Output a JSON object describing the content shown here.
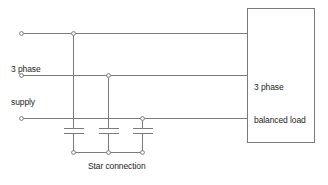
{
  "diagram": {
    "background_color": "#ffffff",
    "line_color": "#7b7b7b",
    "text_color": "#231f20",
    "labels": {
      "supply_line1": "3 phase",
      "supply_line2": "supply",
      "load_line1": "3 phase",
      "load_line2": "balanced load",
      "star": "Star connection"
    },
    "phase_lines": [
      {
        "name": "phase-1",
        "y": 33,
        "x_start": 20,
        "x_end": 247
      },
      {
        "name": "phase-2",
        "y": 75,
        "x_start": 20,
        "x_end": 247
      },
      {
        "name": "phase-3",
        "y": 118,
        "x_start": 20,
        "x_end": 247
      }
    ],
    "supply_terminals": [
      {
        "name": "supply-terminal-1",
        "cx": 21,
        "cy": 33
      },
      {
        "name": "supply-terminal-2",
        "cx": 21,
        "cy": 75
      },
      {
        "name": "supply-terminal-3",
        "cx": 21,
        "cy": 118
      }
    ],
    "tap_nodes": [
      {
        "name": "tap-node-1",
        "cx": 73,
        "cy": 33
      },
      {
        "name": "tap-node-2",
        "cx": 108,
        "cy": 75
      },
      {
        "name": "tap-node-3",
        "cx": 142,
        "cy": 118
      }
    ],
    "capacitors": [
      {
        "name": "capacitor-1",
        "x": 73,
        "top_y": 33,
        "plate_top_y": 128,
        "plate_bottom_y": 133,
        "plate_half_width": 10,
        "bottom_y": 152
      },
      {
        "name": "capacitor-2",
        "x": 108,
        "top_y": 75,
        "plate_top_y": 128,
        "plate_bottom_y": 133,
        "plate_half_width": 10,
        "bottom_y": 152
      },
      {
        "name": "capacitor-3",
        "x": 142,
        "top_y": 118,
        "plate_top_y": 128,
        "plate_bottom_y": 133,
        "plate_half_width": 10,
        "bottom_y": 152
      }
    ],
    "neutral_rail": {
      "name": "neutral-rail",
      "y": 152,
      "x_start": 73,
      "x_end": 142
    },
    "neutral_nodes": [
      {
        "name": "neutral-node-1",
        "cx": 73,
        "cy": 152
      },
      {
        "name": "neutral-node-2",
        "cx": 108,
        "cy": 152
      },
      {
        "name": "neutral-node-3",
        "cx": 142,
        "cy": 152
      }
    ],
    "load_box": {
      "name": "load-box",
      "x": 247,
      "y": 8,
      "width": 68,
      "height": 135
    }
  }
}
